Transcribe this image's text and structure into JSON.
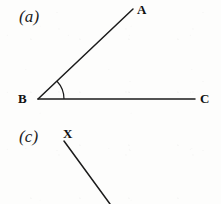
{
  "figure": {
    "background_color": "#fdfdfc",
    "ink_color": "#1b1b1b",
    "part_labels": [
      {
        "id": "a",
        "text": "(a)",
        "x": 19,
        "y": 8
      },
      {
        "id": "c",
        "text": "(c)",
        "x": 19,
        "y": 128
      }
    ],
    "point_labels": [
      {
        "id": "A",
        "text": "A",
        "x": 137,
        "y": 3
      },
      {
        "id": "B",
        "text": "B",
        "x": 18,
        "y": 92
      },
      {
        "id": "C",
        "text": "C",
        "x": 200,
        "y": 92
      },
      {
        "id": "X",
        "text": "X",
        "x": 63,
        "y": 127
      }
    ],
    "geometry": {
      "vertex_b": {
        "x": 38,
        "y": 99
      },
      "ray_ba": {
        "x1": 38,
        "y1": 99,
        "x2": 133,
        "y2": 9
      },
      "ray_bc": {
        "x1": 38,
        "y1": 99,
        "x2": 195,
        "y2": 99
      },
      "angle_arc": {
        "center_x": 38,
        "center_y": 99,
        "radius": 26,
        "start_angle_deg": 0,
        "end_angle_deg": 43,
        "path": "M 64 99 A 26 26 0 0 0 57 81"
      },
      "ray_x": {
        "x1": 64,
        "y1": 141,
        "x2": 110,
        "y2": 204
      },
      "stroke_width": 1.5
    }
  }
}
